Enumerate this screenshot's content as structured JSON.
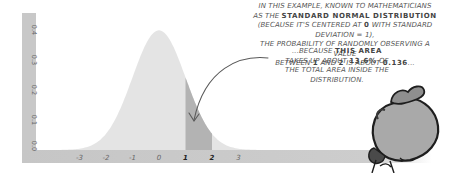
{
  "chart_data": {
    "type": "area",
    "title": "",
    "xlabel": "",
    "ylabel": "",
    "x_ticks": [
      "-3",
      "-2",
      "-1",
      "0",
      "1",
      "2",
      "3"
    ],
    "y_ticks": [
      "0.0",
      "0.1",
      "0.2",
      "0.3",
      "0.4"
    ],
    "xlim": [
      -4,
      4
    ],
    "ylim": [
      0,
      0.42
    ],
    "grid": false,
    "series": [
      {
        "name": "Standard normal density",
        "mean": 0,
        "sd": 1,
        "x": [
          -4,
          -3,
          -2,
          -1,
          0,
          1,
          2,
          3,
          4
        ],
        "values": [
          0.0001,
          0.0044,
          0.054,
          0.242,
          0.399,
          0.242,
          0.054,
          0.0044,
          0.0001
        ]
      }
    ],
    "highlight": {
      "from": 1,
      "to": 2,
      "area": 0.136,
      "percent": "13.6%"
    },
    "colors": {
      "axis_bar": "#c9c9c9",
      "curve_fill": "#e4e4e4",
      "highlight_fill": "#b3b3b3",
      "tick_text": "#555555",
      "arrow": "#555555"
    }
  },
  "annotations": {
    "main": {
      "l1_pre": "In this example, known to mathematicians",
      "l2_pre": "as the ",
      "l2_bold": "standard normal distribution",
      "l3": "(because it's centered at ",
      "l3_b1": "0",
      "l3_post": " with standard deviation = 1),",
      "l4": "the probability of randomly observing a value",
      "l5_pre": "between ",
      "l5_b1": "1",
      "l5_mid": " and ",
      "l5_b2": "2",
      "l5_mid2": " is about ",
      "l5_b3": "0.136",
      "l5_post": "..."
    },
    "secondary": {
      "l1_pre": "...because ",
      "l1_bold": "this area",
      "l2_pre": "takes up about ",
      "l2_bold": "13.6%",
      "l2_post": " of",
      "l3": "the total area inside the",
      "l4": "distribution."
    }
  },
  "illustration": {
    "name": "character-carrying-sack"
  }
}
